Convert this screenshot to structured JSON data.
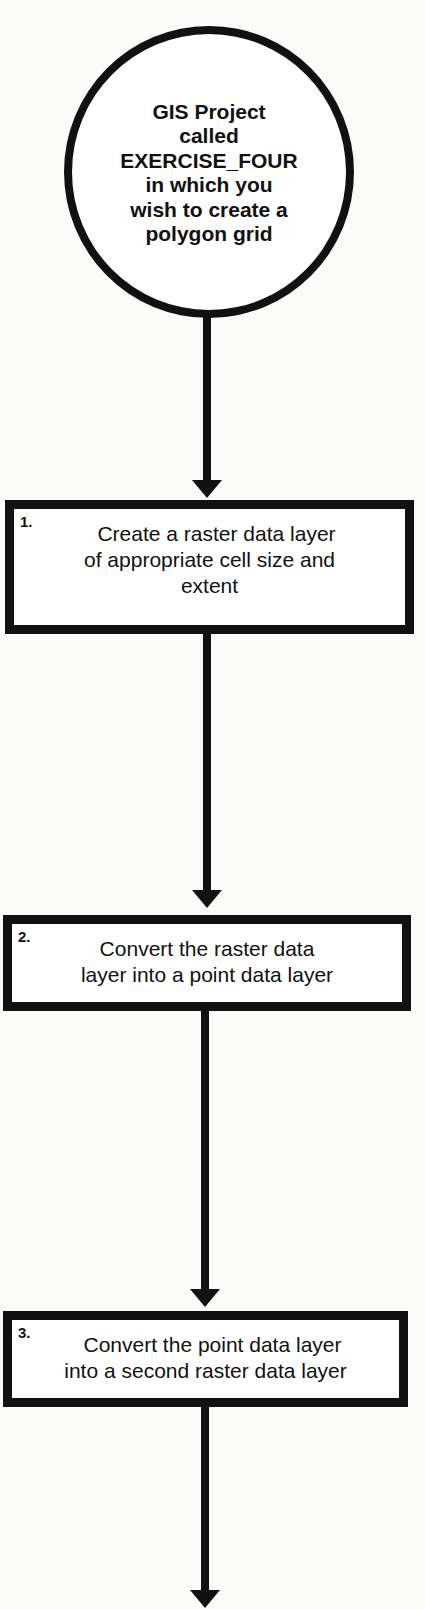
{
  "diagram": {
    "type": "flowchart",
    "start": {
      "shape": "circle",
      "text": "GIS Project called EXERCISE_FOUR in which you wish to create a polygon grid",
      "lines": [
        "GIS Project",
        "called",
        "EXERCISE_FOUR",
        "in which you",
        "wish to create a",
        "polygon grid"
      ]
    },
    "steps": [
      {
        "number": "1.",
        "text": "Create a raster data layer of appropriate cell size and extent",
        "lines": [
          "Create a raster data layer",
          "of appropriate cell size and",
          "extent"
        ]
      },
      {
        "number": "2.",
        "text": "Convert the raster data layer into a point data layer",
        "lines": [
          "Convert the raster data",
          "layer into a point data layer"
        ]
      },
      {
        "number": "3.",
        "text": "Convert the point data layer into a second raster data layer",
        "lines": [
          "Convert the point data layer",
          "into a second raster data layer"
        ]
      }
    ],
    "connectors": [
      {
        "from": "start",
        "to": "step-1",
        "style": "arrow-down"
      },
      {
        "from": "step-1",
        "to": "step-2",
        "style": "arrow-down"
      },
      {
        "from": "step-2",
        "to": "step-3",
        "style": "arrow-down"
      },
      {
        "from": "step-3",
        "to": "continues-below",
        "style": "arrow-down"
      }
    ],
    "colors": {
      "stroke": "#111111",
      "fill": "#ffffff",
      "background": "#fbfbfa"
    }
  }
}
